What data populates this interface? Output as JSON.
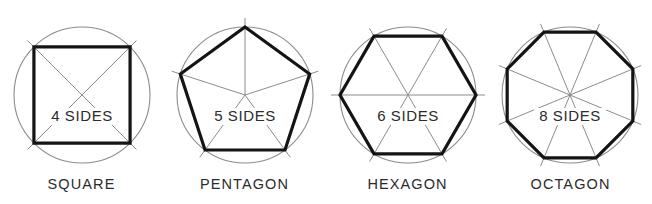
{
  "figure": {
    "background_color": "#ffffff",
    "ink_color": "#1a1a1a",
    "construction_color": "#8c8c8c",
    "circle_color": "#8c8c8c",
    "width": 652,
    "height": 204
  },
  "shapes": [
    {
      "name": "square",
      "caption": "SQUARE",
      "sides_text": "4 SIDES",
      "sides": 4,
      "center_x": 82,
      "center_y": 95,
      "radius": 68,
      "rotation_deg": 45,
      "polygon_stroke": "#141414",
      "polygon_stroke_width": 3.2,
      "circle_stroke": "#8c8c8c",
      "circle_stroke_width": 1.1,
      "radial_stroke": "#8c8c8c",
      "radial_stroke_width": 1.0,
      "tick_overshoot": 9,
      "sides_text_x": 82,
      "sides_text_y": 121
    },
    {
      "name": "pentagon",
      "caption": "PENTAGON",
      "sides_text": "5 SIDES",
      "sides": 5,
      "center_x": 245,
      "center_y": 95,
      "radius": 68,
      "rotation_deg": -90,
      "polygon_stroke": "#141414",
      "polygon_stroke_width": 3.2,
      "circle_stroke": "#8c8c8c",
      "circle_stroke_width": 1.1,
      "radial_stroke": "#8c8c8c",
      "radial_stroke_width": 1.0,
      "tick_overshoot": 9,
      "sides_text_x": 245,
      "sides_text_y": 121
    },
    {
      "name": "hexagon",
      "caption": "HEXAGON",
      "sides_text": "6 SIDES",
      "sides": 6,
      "center_x": 408,
      "center_y": 95,
      "radius": 68,
      "rotation_deg": 0,
      "polygon_stroke": "#141414",
      "polygon_stroke_width": 3.2,
      "circle_stroke": "#8c8c8c",
      "circle_stroke_width": 1.1,
      "radial_stroke": "#8c8c8c",
      "radial_stroke_width": 1.0,
      "tick_overshoot": 9,
      "sides_text_x": 408,
      "sides_text_y": 121
    },
    {
      "name": "octagon",
      "caption": "OCTAGON",
      "sides_text": "8 SIDES",
      "sides": 8,
      "center_x": 570,
      "center_y": 95,
      "radius": 68,
      "rotation_deg": -67.5,
      "polygon_stroke": "#141414",
      "polygon_stroke_width": 3.2,
      "circle_stroke": "#8c8c8c",
      "circle_stroke_width": 1.1,
      "radial_stroke": "#8c8c8c",
      "radial_stroke_width": 1.0,
      "tick_overshoot": 9,
      "sides_text_x": 570,
      "sides_text_y": 121
    }
  ]
}
